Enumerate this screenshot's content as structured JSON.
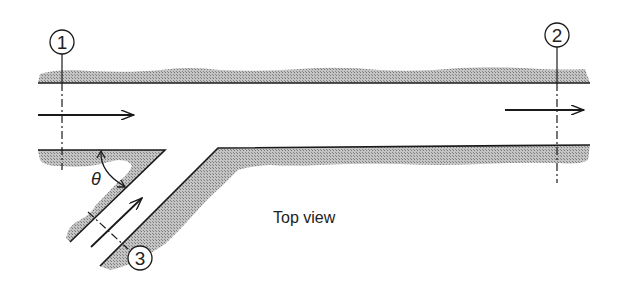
{
  "diagram": {
    "title": "Top view",
    "theta_label": "θ",
    "sections": [
      {
        "id": "section-1",
        "label": "1"
      },
      {
        "id": "section-2",
        "label": "2"
      },
      {
        "id": "section-3",
        "label": "3"
      }
    ],
    "colors": {
      "line": "#1a1a1a",
      "hatch": "#9a9a9a",
      "background": "#ffffff"
    }
  }
}
